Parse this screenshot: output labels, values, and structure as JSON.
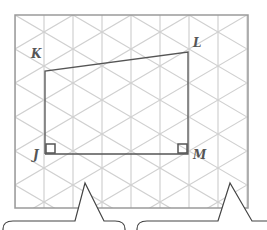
{
  "diagram": {
    "grid": {
      "frame": {
        "x": 15,
        "y": 15,
        "width": 233,
        "height": 193
      },
      "spacing_x": 29,
      "spacing_y": 34,
      "grid_color": "#d0d0d0",
      "frame_color": "#9a9a9a"
    },
    "quadrilateral": {
      "color": "#555555",
      "vertices": {
        "J": {
          "x": 45,
          "y": 154
        },
        "K": {
          "x": 45,
          "y": 71
        },
        "L": {
          "x": 188,
          "y": 52
        },
        "M": {
          "x": 188,
          "y": 154
        }
      }
    },
    "labels": {
      "J": "J",
      "K": "K",
      "L": "L",
      "M": "M"
    },
    "right_angle_markers": [
      "J",
      "M"
    ],
    "callouts": [
      {
        "tip": [
          85,
          183
        ],
        "base_left": 75,
        "base_right": 104,
        "left": 3,
        "right": 125,
        "top": 221
      },
      {
        "tip": [
          230,
          183
        ],
        "base_left": 218,
        "base_right": 252,
        "left": 137,
        "right": 275,
        "top": 221
      }
    ]
  }
}
